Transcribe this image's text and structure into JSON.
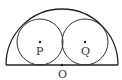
{
  "diagram": {
    "type": "geometry",
    "colors": {
      "stroke": "#222222",
      "label": "#333333",
      "background": "#ffffff"
    },
    "semicircle": {
      "center": [
        62,
        65
      ],
      "radius": 56
    },
    "circles": [
      {
        "name": "P",
        "center": [
          40,
          42
        ],
        "radius": 23
      },
      {
        "name": "Q",
        "center": [
          85,
          42
        ],
        "radius": 23
      }
    ],
    "points": [
      {
        "name": "P",
        "x": 40,
        "y": 42,
        "label": "P"
      },
      {
        "name": "Q",
        "x": 85,
        "y": 42,
        "label": "Q"
      },
      {
        "name": "O",
        "x": 62,
        "y": 65,
        "label": "O"
      }
    ]
  }
}
